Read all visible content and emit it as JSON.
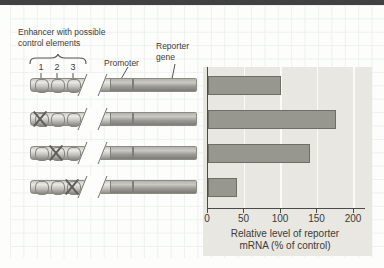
{
  "labels": {
    "enhancer_line1": "Enhancer with possible",
    "enhancer_line2": "control elements",
    "element_numbers": [
      "1",
      "2",
      "3"
    ],
    "promoter": "Promoter",
    "reporter_line1": "Reporter",
    "reporter_line2": "gene"
  },
  "constructs": [
    {
      "name": "enhancer-intact-control",
      "crossed_element": null
    },
    {
      "name": "element-1-crossed-out",
      "crossed_element": 1
    },
    {
      "name": "element-2-crossed-out",
      "crossed_element": 2
    },
    {
      "name": "element-3-crossed-out",
      "crossed_element": 3
    }
  ],
  "chart_data": {
    "type": "bar",
    "orientation": "horizontal",
    "title": "",
    "categories": [
      "Enhancer intact (control)",
      "Control element 1 crossed out",
      "Control element 2 crossed out",
      "Control element 3 crossed out"
    ],
    "values": [
      100,
      175,
      140,
      40
    ],
    "xlabel_line1": "Relative level of reporter",
    "xlabel_line2": "mRNA (% of control)",
    "xticks": [
      0,
      50,
      100,
      150,
      200
    ],
    "xlim": [
      0,
      212
    ],
    "grid": true,
    "legend": "none",
    "colors": {
      "bar_fill": "#98978f",
      "bar_border": "#6f6e66",
      "panel_bg": "#e8e7e2",
      "axis": "#4a4a46"
    }
  }
}
